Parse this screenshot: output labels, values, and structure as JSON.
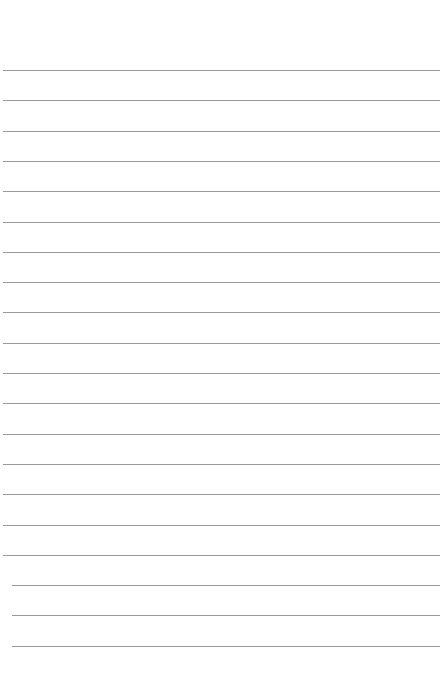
{
  "page": {
    "type": "lined-paper",
    "background": "#ffffff",
    "line_color": "#9a9a9a",
    "first_line_y": 70,
    "line_spacing": 30.3,
    "line_count": 20
  }
}
